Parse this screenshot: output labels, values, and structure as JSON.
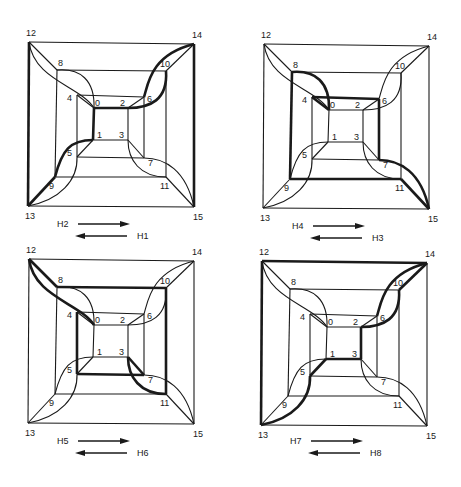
{
  "figure": {
    "nodes": {
      "12": [
        29,
        42
      ],
      "14": [
        194,
        44
      ],
      "13": [
        28,
        206
      ],
      "15": [
        194,
        207
      ],
      "8": [
        57,
        70
      ],
      "10": [
        166,
        71
      ],
      "9": [
        55,
        177
      ],
      "11": [
        166,
        177
      ],
      "4": [
        77,
        95
      ],
      "6": [
        144,
        97
      ],
      "5": [
        77,
        157
      ],
      "7": [
        144,
        158
      ],
      "0": [
        94,
        108
      ],
      "2": [
        128,
        108
      ],
      "1": [
        93,
        140
      ],
      "3": [
        128,
        140
      ]
    },
    "label_offsets": {
      "12": [
        -3,
        -6
      ],
      "14": [
        -2,
        -6
      ],
      "13": [
        -3,
        13
      ],
      "15": [
        -1,
        13
      ],
      "8": [
        1,
        -4
      ],
      "10": [
        -6,
        -4
      ],
      "9": [
        -6,
        12
      ],
      "11": [
        -6,
        12
      ],
      "4": [
        -10,
        6
      ],
      "6": [
        3,
        5
      ],
      "5": [
        -10,
        -1
      ],
      "7": [
        4,
        8
      ],
      "0": [
        1,
        -2
      ],
      "2": [
        -8,
        -2
      ],
      "1": [
        4,
        -2
      ],
      "3": [
        -9,
        -2
      ]
    },
    "straight_edges": [
      [
        "12",
        "14"
      ],
      [
        "14",
        "15"
      ],
      [
        "15",
        "13"
      ],
      [
        "13",
        "12"
      ],
      [
        "8",
        "10"
      ],
      [
        "10",
        "11"
      ],
      [
        "11",
        "9"
      ],
      [
        "9",
        "8"
      ],
      [
        "4",
        "6"
      ],
      [
        "6",
        "7"
      ],
      [
        "7",
        "5"
      ],
      [
        "5",
        "4"
      ],
      [
        "0",
        "2"
      ],
      [
        "2",
        "3"
      ],
      [
        "3",
        "1"
      ],
      [
        "1",
        "0"
      ],
      [
        "12",
        "8"
      ],
      [
        "14",
        "10"
      ],
      [
        "13",
        "9"
      ],
      [
        "15",
        "11"
      ],
      [
        "4",
        "0"
      ],
      [
        "6",
        "2"
      ],
      [
        "5",
        "1"
      ],
      [
        "7",
        "3"
      ]
    ],
    "curved_edges": [
      {
        "id": "c12-0",
        "from": "12",
        "to": "0",
        "c1": [
          34,
          80
        ],
        "c2": [
          80,
          86
        ]
      },
      {
        "id": "c8-0",
        "from": "8",
        "to": "0",
        "c1": [
          80,
          68
        ],
        "c2": [
          95,
          80
        ]
      },
      {
        "id": "c14-6",
        "from": "14",
        "to": "6",
        "c1": [
          150,
          55
        ],
        "c2": [
          148,
          85
        ]
      },
      {
        "id": "c10-2",
        "from": "10",
        "to": "2",
        "c1": [
          168,
          100
        ],
        "c2": [
          150,
          108
        ]
      },
      {
        "id": "c13-5",
        "from": "13",
        "to": "5",
        "c1": [
          60,
          200
        ],
        "c2": [
          78,
          180
        ]
      },
      {
        "id": "c9-1",
        "from": "9",
        "to": "1",
        "c1": [
          62,
          150
        ],
        "c2": [
          70,
          140
        ]
      },
      {
        "id": "c15-7",
        "from": "15",
        "to": "7",
        "c1": [
          186,
          170
        ],
        "c2": [
          165,
          158
        ]
      },
      {
        "id": "c11-3",
        "from": "11",
        "to": "3",
        "c1": [
          140,
          177
        ],
        "c2": [
          128,
          160
        ]
      }
    ],
    "panels": [
      {
        "id": "panel-h1-h2",
        "offset": [
          0,
          0
        ],
        "thick_edges": [
          "13-12",
          "13-9",
          "c9-1",
          "1-0",
          "0-2",
          "c10-2",
          "c14-6",
          "14-15"
        ],
        "legend": {
          "forward": "H2",
          "backward": "H1",
          "y": 224
        }
      },
      {
        "id": "panel-h3-h4",
        "offset": [
          235,
          2
        ],
        "thick_edges": [
          "9-8",
          "c8-0",
          "4-6",
          "6-7",
          "c15-7",
          "15-11",
          "11-9",
          "4-0"
        ],
        "legend": {
          "forward": "H4",
          "backward": "H3",
          "y": 224
        }
      },
      {
        "id": "panel-h5-h6",
        "offset": [
          0,
          217
        ],
        "thick_edges": [
          "12-8",
          "8-10",
          "10-11",
          "c11-3",
          "3-7",
          "7-5",
          "5-4",
          "c12-0"
        ],
        "legend": {
          "forward": "H5",
          "backward": "H6",
          "y": 224
        }
      },
      {
        "id": "panel-h7-h8",
        "offset": [
          233,
          219
        ],
        "thick_edges": [
          "12-14",
          "13-12",
          "13-5",
          "c13-5",
          "5-1",
          "1-3",
          "3-2",
          "c10-2",
          "14-10",
          "c14-6"
        ],
        "legend": {
          "forward": "H7",
          "backward": "H8",
          "y": 222
        }
      }
    ]
  }
}
